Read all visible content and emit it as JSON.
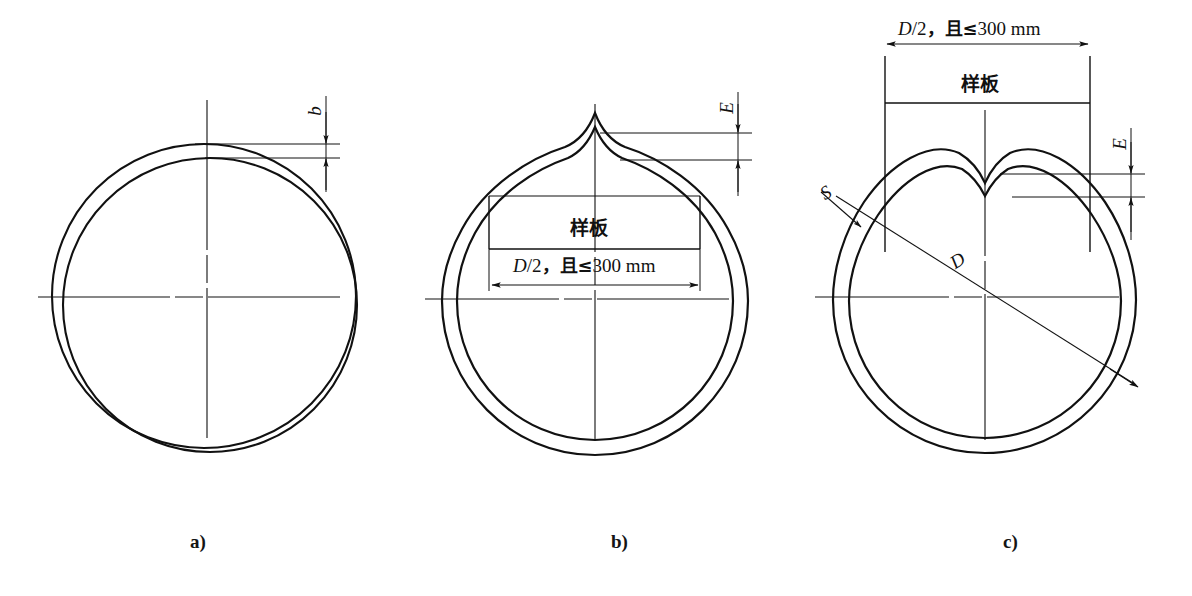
{
  "figure": {
    "title_caption": "",
    "background_color": "#ffffff",
    "line_color": "#111111",
    "width": 1192,
    "height": 596
  },
  "panels": [
    {
      "id": "a",
      "caption": "a)",
      "description": "Two offset circles showing out-of-roundness deviation b",
      "dimensions": [
        {
          "name": "b",
          "label": "b",
          "orientation": "vertical-rotated"
        }
      ],
      "template_label": null
    },
    {
      "id": "b",
      "caption": "b)",
      "description": "Circle with outward peak at top, template chord and deviation E",
      "dimensions": [
        {
          "name": "E",
          "label": "E",
          "orientation": "vertical-rotated"
        },
        {
          "name": "chord",
          "label_prefix": "D/2",
          "label_comma": ",",
          "label_cjk": "且",
          "label_op": "≤",
          "label_value": "300 mm",
          "full": "D/2，且≤300 mm"
        }
      ],
      "template_label": "样板"
    },
    {
      "id": "c",
      "caption": "c)",
      "description": "Circle with inward V-notch at top, external template box, diameter D, wall thickness S and deviation E",
      "dimensions": [
        {
          "name": "E",
          "label": "E",
          "orientation": "vertical-rotated"
        },
        {
          "name": "D",
          "label": "D",
          "orientation": "diagonal"
        },
        {
          "name": "S",
          "label": "S",
          "orientation": "leader"
        },
        {
          "name": "chord",
          "label_prefix": "D/2",
          "label_comma": ",",
          "label_cjk": "且",
          "label_op": "≤",
          "label_value": "300 mm",
          "full": "D/2，且≤300 mm"
        }
      ],
      "template_label": "样板"
    }
  ],
  "labels": {
    "caption_a": "a)",
    "caption_b": "b)",
    "caption_c": "c)",
    "dim_b": "b",
    "dim_E_b": "E",
    "dim_E_c": "E",
    "dim_D": "D",
    "dim_S": "S",
    "template_b": "样板",
    "template_c": "样板",
    "chord_prefix_b": "D",
    "chord_slash_b": "/2",
    "chord_comma_b": "，",
    "chord_cjk_b": "且",
    "chord_op_b": "≤",
    "chord_val_b": "300 mm",
    "chord_prefix_c": "D",
    "chord_slash_c": "/2",
    "chord_comma_c": "，",
    "chord_cjk_c": "且",
    "chord_op_c": "≤",
    "chord_val_c": "300 mm"
  }
}
